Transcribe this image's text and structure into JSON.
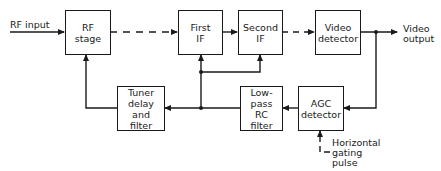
{
  "diagram": {
    "type": "block-diagram",
    "blocks": [
      {
        "id": "rf_stage",
        "lines": [
          "RF",
          "stage"
        ]
      },
      {
        "id": "first_if",
        "lines": [
          "First",
          "IF"
        ]
      },
      {
        "id": "second_if",
        "lines": [
          "Second",
          "IF"
        ]
      },
      {
        "id": "video_detector",
        "lines": [
          "Video",
          "detector"
        ]
      },
      {
        "id": "tuner_delay",
        "lines": [
          "Tuner",
          "delay",
          "and",
          "filter"
        ]
      },
      {
        "id": "lowpass_rc",
        "lines": [
          "Low-pass",
          "RC",
          "filter"
        ]
      },
      {
        "id": "agc_detector",
        "lines": [
          "AGC",
          "detector"
        ]
      }
    ],
    "labels": {
      "rf_input": "RF input",
      "video_output": [
        "Video",
        "output"
      ],
      "gating_pulse": [
        "Horizontal",
        "gating",
        "pulse"
      ]
    },
    "connections": [
      {
        "from": "RF input",
        "to": "rf_stage",
        "style": "solid"
      },
      {
        "from": "rf_stage",
        "to": "first_if",
        "style": "dashed"
      },
      {
        "from": "first_if",
        "to": "second_if",
        "style": "solid"
      },
      {
        "from": "second_if",
        "to": "video_detector",
        "style": "dashed"
      },
      {
        "from": "video_detector",
        "to": "Video output",
        "style": "solid"
      },
      {
        "from": "video_detector",
        "to": "agc_detector",
        "style": "solid"
      },
      {
        "from": "agc_detector",
        "to": "lowpass_rc",
        "style": "solid"
      },
      {
        "from": "lowpass_rc",
        "to": "tuner_delay",
        "style": "solid"
      },
      {
        "from": "lowpass_rc",
        "to": "first_if",
        "style": "solid"
      },
      {
        "from": "lowpass_rc",
        "to": "second_if",
        "style": "solid"
      },
      {
        "from": "tuner_delay",
        "to": "rf_stage",
        "style": "solid"
      },
      {
        "from": "Horizontal gating pulse",
        "to": "agc_detector",
        "style": "dashed"
      }
    ],
    "colors": {
      "stroke": "#1a1a1a",
      "background": "#ffffff"
    }
  }
}
